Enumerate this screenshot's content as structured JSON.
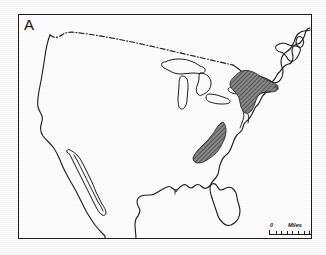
{
  "figure": {
    "panel_label": "A",
    "caption_type": "distribution-map",
    "region": "Contiguous United States"
  },
  "map": {
    "frame_color": "#1a1a1a",
    "land_outline_color": "#1a1a1a",
    "background_color": "#ffffff",
    "shaded_region_color": "#6e6e6e",
    "border_line_style": "dash-dot",
    "features": {
      "coastline": "coastline-outline",
      "great_lakes": "great-lakes-outline",
      "canadian_border": "us-canada-border-dashdot",
      "baja_peninsula": "baja-california-outline",
      "florida_peninsula": "florida-peninsula-outline"
    },
    "shaded_regions": [
      {
        "id": "northeast-range",
        "label": "Northeast shaded distribution area",
        "fill": "hatched-gray"
      },
      {
        "id": "southern-appalachian-range",
        "label": "Southern Appalachian shaded distribution area",
        "fill": "hatched-gray"
      }
    ]
  },
  "scale_bar": {
    "min_label": "0",
    "unit_label": "Miles",
    "max_label": "500",
    "ticks": 10
  }
}
